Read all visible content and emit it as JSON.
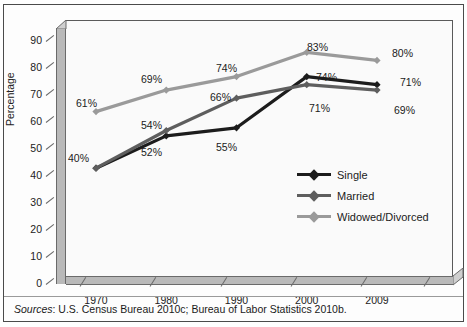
{
  "figure": {
    "top_cropped_text": "",
    "source_prefix": "Sources",
    "source_text": ": U.S. Census Bureau 2010c; Bureau of Labor Statistics 2010b."
  },
  "chart_data": {
    "type": "line",
    "title": "",
    "subtitle": "",
    "xlabel": "",
    "ylabel": "Percentage",
    "categories": [
      "1970",
      "1980",
      "1990",
      "2000",
      "2009"
    ],
    "ylim": [
      0,
      95
    ],
    "yticks": [
      0,
      10,
      20,
      30,
      40,
      50,
      60,
      70,
      80,
      90
    ],
    "ytick_labels": [
      "0",
      "10",
      "20",
      "30",
      "40",
      "50",
      "60",
      "70",
      "80",
      "90"
    ],
    "grid": false,
    "legend_position": "inside-right",
    "series": [
      {
        "name": "Single",
        "color": "#1c1c1c",
        "values": [
          40,
          52,
          55,
          74,
          71
        ],
        "labels": [
          "40%",
          "52%",
          "55%",
          "74%",
          "71%"
        ]
      },
      {
        "name": "Married",
        "color": "#5e5e5e",
        "values": [
          40,
          54,
          66,
          71,
          69
        ],
        "labels": [
          "40%",
          "54%",
          "66%",
          "71%",
          "69%"
        ]
      },
      {
        "name": "Widowed/Divorced",
        "color": "#9a9a9a",
        "values": [
          61,
          69,
          74,
          83,
          80
        ],
        "labels": [
          "61%",
          "69%",
          "74%",
          "83%",
          "80%"
        ]
      }
    ],
    "point_labels": [
      {
        "text": "61%",
        "x": 66,
        "y": 92,
        "series": "Widowed/Divorced"
      },
      {
        "text": "40%",
        "x": 58,
        "y": 147,
        "series": "Single"
      },
      {
        "text": "69%",
        "x": 131,
        "y": 68,
        "series": "Widowed/Divorced"
      },
      {
        "text": "54%",
        "x": 131,
        "y": 114,
        "series": "Married"
      },
      {
        "text": "52%",
        "x": 131,
        "y": 141,
        "series": "Single"
      },
      {
        "text": "74%",
        "x": 206,
        "y": 57,
        "series": "Widowed/Divorced"
      },
      {
        "text": "66%",
        "x": 200,
        "y": 86,
        "series": "Married"
      },
      {
        "text": "55%",
        "x": 206,
        "y": 136,
        "series": "Single"
      },
      {
        "text": "83%",
        "x": 297,
        "y": 36,
        "series": "Widowed/Divorced"
      },
      {
        "text": "74%",
        "x": 306,
        "y": 66,
        "series": "Single"
      },
      {
        "text": "71%",
        "x": 299,
        "y": 97,
        "series": "Married"
      },
      {
        "text": "80%",
        "x": 382,
        "y": 42,
        "series": "Widowed/Divorced"
      },
      {
        "text": "71%",
        "x": 390,
        "y": 71,
        "series": "Single"
      },
      {
        "text": "69%",
        "x": 384,
        "y": 99,
        "series": "Married"
      }
    ]
  }
}
